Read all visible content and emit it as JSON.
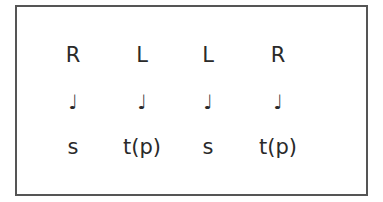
{
  "figure": {
    "columns": [
      {
        "hand": "R",
        "note": "♩",
        "stroke": "s"
      },
      {
        "hand": "L",
        "note": "♩",
        "stroke": "t(p)"
      },
      {
        "hand": "L",
        "note": "♩",
        "stroke": "s"
      },
      {
        "hand": "R",
        "note": "♩",
        "stroke": "t(p)"
      }
    ]
  }
}
